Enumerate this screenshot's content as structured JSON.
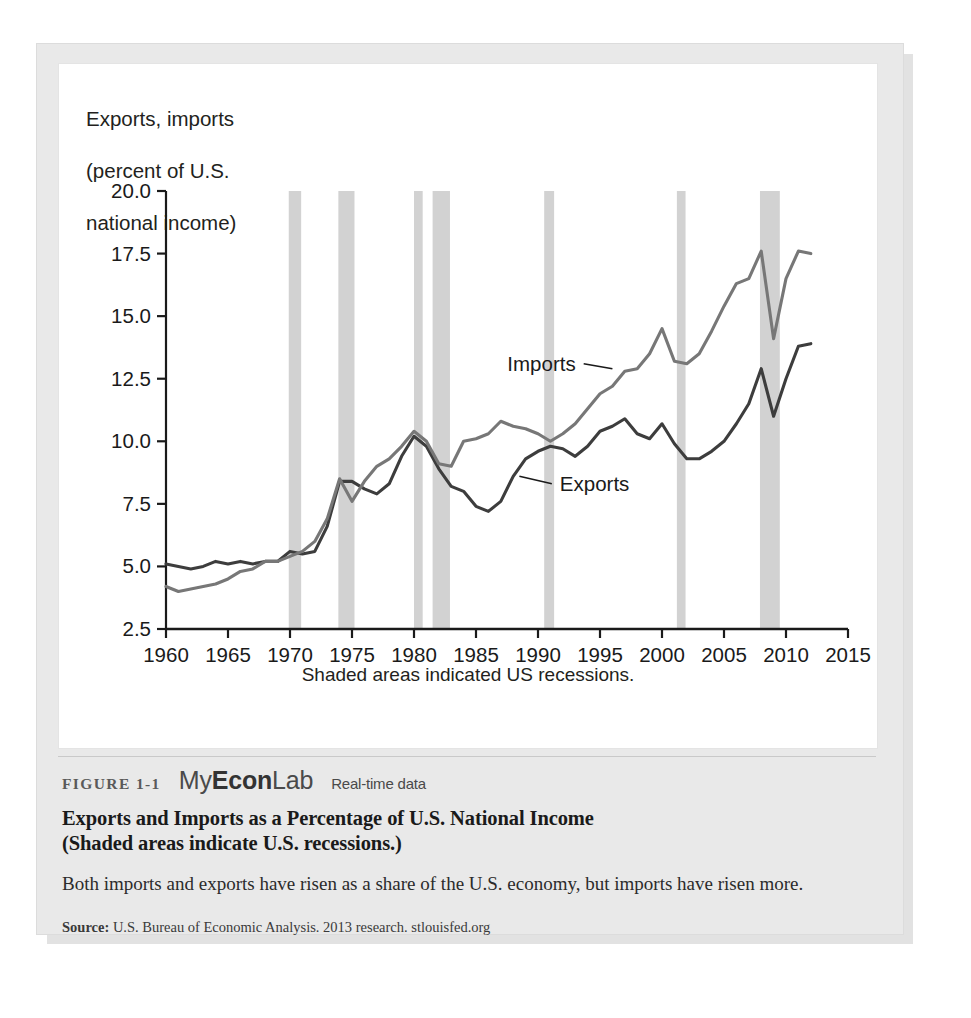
{
  "figure": {
    "number": "FIGURE 1-1",
    "brand": "MyEconLab",
    "brand_my": "My",
    "brand_econ": "Econ",
    "brand_lab": "Lab",
    "realtime": "Real-time data",
    "title": "Exports and Imports as a Percentage of U.S. National Income\n(Shaded areas indicate U.S. recessions.)",
    "title_line1": "Exports and Imports as a Percentage of U.S. National Income",
    "title_line2": "(Shaded areas indicate U.S. recessions.)",
    "body": "Both imports and exports have risen as a share of the U.S. economy, but imports have risen more.",
    "source_label": "Source:",
    "source_text": "U.S. Bureau of Economic Analysis. 2013 research. stlouisfed.org"
  },
  "colors": {
    "exports_line": "#3d3d3d",
    "imports_line": "#777777",
    "recession_band": "#d2d2d2",
    "axis": "#1a1a1a",
    "panel_bg": "#e9e9e9",
    "card_bg": "#ffffff"
  },
  "chart_data": {
    "type": "line",
    "title": "",
    "ylabel": "Exports, imports\n(percent of U.S.\nnational income)",
    "ylabel_lines": [
      "Exports, imports",
      "(percent of U.S.",
      "national income)"
    ],
    "xlabel": "",
    "footnote": "Shaded areas indicated US recessions.",
    "xlim": [
      1960,
      2015
    ],
    "ylim": [
      2.5,
      20.0
    ],
    "xticks": [
      1960,
      1965,
      1970,
      1975,
      1980,
      1985,
      1990,
      1995,
      2000,
      2005,
      2010,
      2015
    ],
    "yticks": [
      2.5,
      5.0,
      7.5,
      10.0,
      12.5,
      15.0,
      17.5,
      20.0
    ],
    "ytick_labels": [
      "2.5",
      "5.0",
      "7.5",
      "10.0",
      "12.5",
      "15.0",
      "17.5",
      "20.0"
    ],
    "xtick_labels": [
      "1960",
      "1965",
      "1970",
      "1975",
      "1980",
      "1985",
      "1990",
      "1995",
      "2000",
      "2005",
      "2010",
      "2015"
    ],
    "grid": false,
    "legend_position": "inline-annotation",
    "annotations": [
      {
        "label": "Imports",
        "x": 1996.0,
        "y": 12.9,
        "text_x": 1993.2,
        "text_y": 13.1
      },
      {
        "label": "Exports",
        "x": 1988.5,
        "y": 8.6,
        "text_x": 1991.6,
        "text_y": 8.3
      }
    ],
    "recessions": [
      {
        "start": 1969.9,
        "end": 1970.9
      },
      {
        "start": 1973.9,
        "end": 1975.2
      },
      {
        "start": 1980.0,
        "end": 1980.7
      },
      {
        "start": 1981.5,
        "end": 1982.9
      },
      {
        "start": 1990.5,
        "end": 1991.3
      },
      {
        "start": 2001.2,
        "end": 2001.9
      },
      {
        "start": 2007.9,
        "end": 2009.5
      }
    ],
    "x": [
      1960,
      1961,
      1962,
      1963,
      1964,
      1965,
      1966,
      1967,
      1968,
      1969,
      1970,
      1971,
      1972,
      1973,
      1974,
      1975,
      1976,
      1977,
      1978,
      1979,
      1980,
      1981,
      1982,
      1983,
      1984,
      1985,
      1986,
      1987,
      1988,
      1989,
      1990,
      1991,
      1992,
      1993,
      1994,
      1995,
      1996,
      1997,
      1998,
      1999,
      2000,
      2001,
      2002,
      2003,
      2004,
      2005,
      2006,
      2007,
      2008,
      2009,
      2010,
      2011,
      2012
    ],
    "series": [
      {
        "name": "Exports",
        "color": "#3d3d3d",
        "values": [
          5.1,
          5.0,
          4.9,
          5.0,
          5.2,
          5.1,
          5.2,
          5.1,
          5.2,
          5.2,
          5.6,
          5.5,
          5.6,
          6.6,
          8.4,
          8.4,
          8.1,
          7.9,
          8.3,
          9.4,
          10.2,
          9.8,
          8.9,
          8.2,
          8.0,
          7.4,
          7.2,
          7.6,
          8.6,
          9.3,
          9.6,
          9.8,
          9.7,
          9.4,
          9.8,
          10.4,
          10.6,
          10.9,
          10.3,
          10.1,
          10.7,
          9.9,
          9.3,
          9.3,
          9.6,
          10.0,
          10.7,
          11.5,
          12.9,
          11.0,
          12.5,
          13.8,
          13.9
        ]
      },
      {
        "name": "Imports",
        "color": "#777777",
        "values": [
          4.2,
          4.0,
          4.1,
          4.2,
          4.3,
          4.5,
          4.8,
          4.9,
          5.2,
          5.2,
          5.4,
          5.6,
          6.0,
          6.9,
          8.5,
          7.6,
          8.4,
          9.0,
          9.3,
          9.8,
          10.4,
          10.0,
          9.1,
          9.0,
          10.0,
          10.1,
          10.3,
          10.8,
          10.6,
          10.5,
          10.3,
          10.0,
          10.3,
          10.7,
          11.3,
          11.9,
          12.2,
          12.8,
          12.9,
          13.5,
          14.5,
          13.2,
          13.1,
          13.5,
          14.4,
          15.4,
          16.3,
          16.5,
          17.6,
          14.1,
          16.5,
          17.6,
          17.5
        ]
      }
    ]
  }
}
